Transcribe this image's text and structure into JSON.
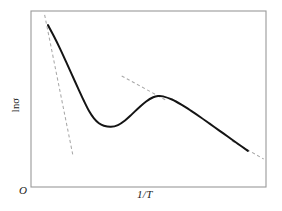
{
  "figure": {
    "origin_label": "O",
    "ylabel": "lnσ",
    "xlabel": "1/T",
    "frame_color": "#9a9a9a",
    "curve_color": "#141414",
    "tangent_color": "#a8a8a8",
    "background": "#ffffff"
  },
  "chart_data": {
    "type": "line",
    "title": "",
    "subtitle": "",
    "xlabel": "1/T",
    "ylabel": "lnσ",
    "grid": false,
    "legend": null,
    "legend_position": "none",
    "axis_origin_label": "O",
    "xlim": [
      0,
      1
    ],
    "ylim": [
      0,
      1
    ],
    "xtick_labels": [],
    "ytick_labels": [],
    "annotations": [],
    "series": [
      {
        "name": "ln sigma vs 1/T",
        "style": "solid",
        "color": "#141414",
        "x": [
          0.072,
          0.098,
          0.124,
          0.149,
          0.174,
          0.2,
          0.225,
          0.247,
          0.268,
          0.289,
          0.31,
          0.34,
          0.37,
          0.4,
          0.43,
          0.46,
          0.49,
          0.52,
          0.541,
          0.562,
          0.6,
          0.64,
          0.68,
          0.72,
          0.76,
          0.8,
          0.84,
          0.88,
          0.923
        ],
        "y": [
          0.92,
          0.855,
          0.785,
          0.712,
          0.638,
          0.562,
          0.49,
          0.432,
          0.39,
          0.362,
          0.348,
          0.342,
          0.352,
          0.378,
          0.414,
          0.452,
          0.486,
          0.51,
          0.517,
          0.515,
          0.497,
          0.468,
          0.434,
          0.398,
          0.36,
          0.322,
          0.284,
          0.246,
          0.205
        ]
      }
    ],
    "tangents": [
      {
        "name": "intrinsic-slope-tangent",
        "style": "dashed",
        "color": "#a8a8a8",
        "x": [
          0.058,
          0.178
        ],
        "y": [
          0.978,
          0.182
        ]
      },
      {
        "name": "saturation-slope-tangent",
        "style": "dashed",
        "color": "#a8a8a8",
        "x": [
          0.386,
          0.572
        ],
        "y": [
          0.631,
          0.495
        ]
      },
      {
        "name": "freeze-out-slope-tangent",
        "style": "dashed",
        "color": "#a8a8a8",
        "x": [
          0.855,
          0.99
        ],
        "y": [
          0.262,
          0.159
        ]
      }
    ]
  }
}
